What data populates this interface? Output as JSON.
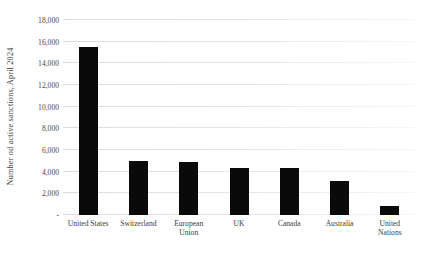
{
  "chart_data": {
    "type": "bar",
    "title": "",
    "subtitle": "",
    "xlabel": "",
    "ylabel": "Number od active sanctions, April 2024",
    "categories": [
      "United States",
      "Switzerland",
      "European Union",
      "UK",
      "Canada",
      "Australia",
      "United Nations"
    ],
    "category_lines": [
      [
        "United States"
      ],
      [
        "Switzerland"
      ],
      [
        "European",
        "Union"
      ],
      [
        "UK"
      ],
      [
        "Canada"
      ],
      [
        "Australia"
      ],
      [
        "United",
        "Nations"
      ]
    ],
    "values": [
      15500,
      5000,
      4900,
      4300,
      4300,
      3100,
      850
    ],
    "ylim": [
      0,
      18000
    ],
    "ytick_values": [
      0,
      2000,
      4000,
      6000,
      8000,
      10000,
      12000,
      14000,
      16000,
      18000
    ],
    "ytick_labels": [
      "-",
      "2,000",
      "4,000",
      "6,000",
      "8,000",
      "10,000",
      "12,000",
      "14,000",
      "16,000",
      "18,000"
    ],
    "grid": true,
    "grid_axis": "y",
    "legend": false,
    "legend_position": "none",
    "bar_color": "#0a0a0a",
    "gridline_color": "#e6e6e6",
    "background_color": "#ffffff"
  }
}
